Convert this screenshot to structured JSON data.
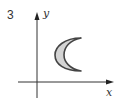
{
  "problem_number": "3",
  "axes": {
    "x_label": "x",
    "y_label": "y"
  },
  "shape": {
    "type": "crescent",
    "fill": "#d4d4d4",
    "stroke": "#444444"
  }
}
